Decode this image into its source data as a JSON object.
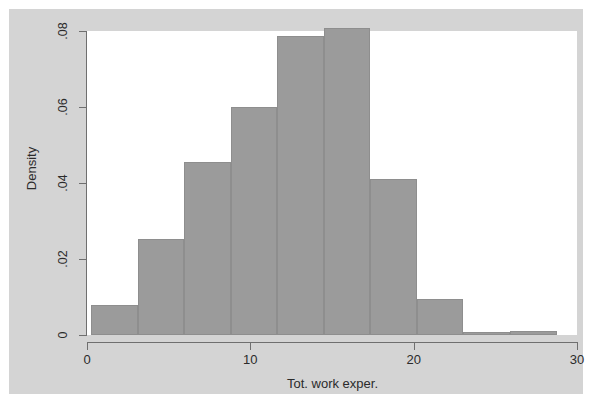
{
  "chart_data": {
    "type": "bar",
    "subtype": "histogram",
    "title": "",
    "subtitle": "",
    "xlabel": "Tot. work exper.",
    "ylabel": "Density",
    "xlim": [
      0,
      30
    ],
    "ylim": [
      0,
      0.08
    ],
    "grid": false,
    "legend": null,
    "x_ticks": [
      0,
      10,
      20,
      30
    ],
    "x_tick_labels": [
      "0",
      "10",
      "20",
      "30"
    ],
    "y_ticks": [
      0,
      0.02,
      0.04,
      0.06,
      0.08
    ],
    "y_tick_labels": [
      "0",
      ".02",
      ".04",
      ".06",
      ".08"
    ],
    "bin_width": 2.85,
    "bins": [
      {
        "x0": 0.25,
        "x1": 3.1,
        "density": 0.008
      },
      {
        "x0": 3.1,
        "x1": 5.95,
        "density": 0.0252
      },
      {
        "x0": 5.95,
        "x1": 8.8,
        "density": 0.0455
      },
      {
        "x0": 8.8,
        "x1": 11.65,
        "density": 0.0601
      },
      {
        "x0": 11.65,
        "x1": 14.5,
        "density": 0.0786
      },
      {
        "x0": 14.5,
        "x1": 17.35,
        "density": 0.0807
      },
      {
        "x0": 17.35,
        "x1": 20.2,
        "density": 0.0411
      },
      {
        "x0": 20.2,
        "x1": 23.05,
        "density": 0.0095
      },
      {
        "x0": 23.05,
        "x1": 25.9,
        "density": 0.0008
      },
      {
        "x0": 25.9,
        "x1": 28.75,
        "density": 0.0011
      }
    ],
    "categories": [
      "0.25-3.1",
      "3.1-5.95",
      "5.95-8.8",
      "8.8-11.65",
      "11.65-14.5",
      "14.5-17.35",
      "17.35-20.2",
      "20.2-23.05",
      "23.05-25.9",
      "25.9-28.75"
    ],
    "values": [
      0.008,
      0.0252,
      0.0455,
      0.0601,
      0.0786,
      0.0807,
      0.0411,
      0.0095,
      0.0008,
      0.0011
    ],
    "colors": {
      "bar_fill": "#9b9b9b",
      "bar_outline": "#8e8e8e",
      "plot_background": "#ffffff",
      "graph_background": "#d4d4d4",
      "page_background": "#ffffff",
      "axis": "#6f6f6f",
      "text": "#2b2b2b"
    }
  }
}
